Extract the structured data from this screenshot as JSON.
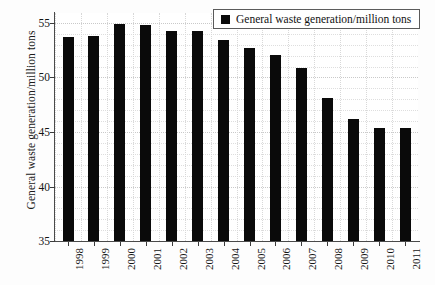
{
  "chart_data": {
    "type": "bar",
    "title": "",
    "xlabel": "",
    "ylabel": "General waste generation/million tons",
    "categories": [
      "1998",
      "1999",
      "2000",
      "2001",
      "2002",
      "2003",
      "2004",
      "2005",
      "2006",
      "2007",
      "2008",
      "2009",
      "2010",
      "2011"
    ],
    "values": [
      53.7,
      53.8,
      54.9,
      54.8,
      54.3,
      54.3,
      53.4,
      52.7,
      52.1,
      50.9,
      48.1,
      46.2,
      45.4,
      45.4
    ],
    "series": [
      {
        "name": "General waste generation/million tons",
        "values": [
          53.7,
          53.8,
          54.9,
          54.8,
          54.3,
          54.3,
          53.4,
          52.7,
          52.1,
          50.9,
          48.1,
          46.2,
          45.4,
          45.4
        ],
        "color": "#0a0a0a"
      }
    ],
    "ylim": [
      35,
      55.9
    ],
    "yticks": [
      35,
      40,
      45,
      50,
      55
    ],
    "ytick_labels": [
      "35",
      "40",
      "45",
      "50",
      "55"
    ],
    "grid": "dotted-both",
    "legend": {
      "position": "top-right",
      "entries": [
        {
          "label": "General waste generation/million tons",
          "marker": "square",
          "color": "#0a0a0a"
        }
      ]
    },
    "bar_color": "#0a0a0a",
    "grid_color": "#cfcfcf",
    "axis_color": "#4a4a4a",
    "background": "#ffffff"
  }
}
